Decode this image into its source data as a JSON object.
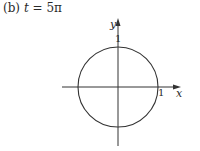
{
  "caption": {
    "label": "(b)",
    "variable": "t",
    "equals": "=",
    "value": "5π"
  },
  "diagram": {
    "type": "unit-circle-plot",
    "axes": {
      "x_label": "x",
      "y_label": "y",
      "x_tick_label": "1",
      "y_tick_label": "1"
    },
    "circle": {
      "center": [
        0,
        0
      ],
      "radius": 1
    },
    "colors": {
      "stroke": "#333333",
      "text": "#2a2a2a",
      "background": "#ffffff"
    }
  }
}
